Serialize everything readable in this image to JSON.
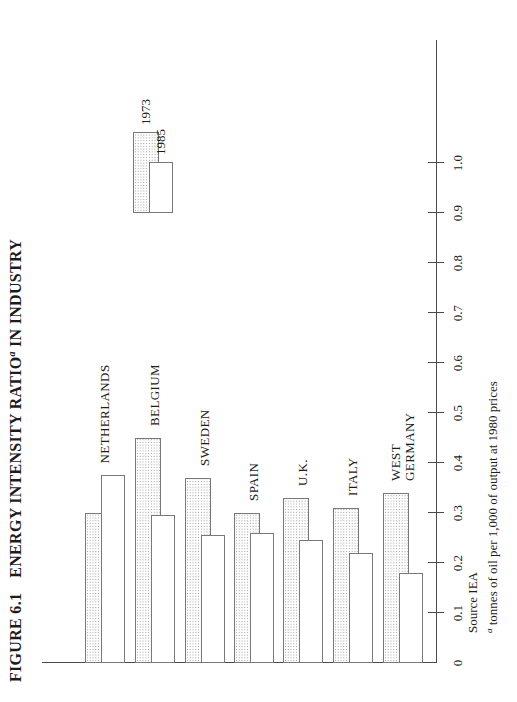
{
  "figure": {
    "title_label": "FIGURE 6.1",
    "title_main": "ENERGY INTENSITY RATIO",
    "title_sup": "a",
    "title_tail": " IN INDUSTRY",
    "source": "Source IEA",
    "footnote_sup": "a",
    "footnote_text": " tonnes of oil per 1,000 of output at 1980 prices"
  },
  "legend": {
    "position": "top-right",
    "items": [
      {
        "label": "1973",
        "pattern": "hatched-dot-screen"
      },
      {
        "label": "1985",
        "pattern": "open-white"
      }
    ]
  },
  "chart_data": {
    "type": "bar",
    "orientation": "horizontal bars; whole figure printed rotated 90° counterclockwise on the page",
    "categories": [
      "NETHERLANDS",
      "BELGIUM",
      "SWEDEN",
      "SPAIN",
      "U.K.",
      "ITALY",
      "WEST\nGERMANY"
    ],
    "series": [
      {
        "name": "1973",
        "values": [
          0.3,
          0.45,
          0.37,
          0.3,
          0.33,
          0.31,
          0.34
        ]
      },
      {
        "name": "1985",
        "values": [
          0.375,
          0.295,
          0.255,
          0.26,
          0.245,
          0.22,
          0.18
        ]
      }
    ],
    "value_axis": {
      "min": 0,
      "max": 1.0,
      "tick_step": 0.1,
      "tick_labels": [
        "0",
        "0.1",
        "0.2",
        "0.3",
        "0.4",
        "0.5",
        "0.6",
        "0.7",
        "0.8",
        "0.9",
        "1.0"
      ]
    },
    "unit": "tonnes of oil per 1,000 of output at 1980 prices",
    "source": "IEA",
    "grid": false,
    "legend_position": "top-right",
    "colors": {
      "ink": "#4a4a4a",
      "bar_border": "#787878",
      "hatch_dot": "#9f9f9f",
      "background": "#ffffff"
    }
  }
}
